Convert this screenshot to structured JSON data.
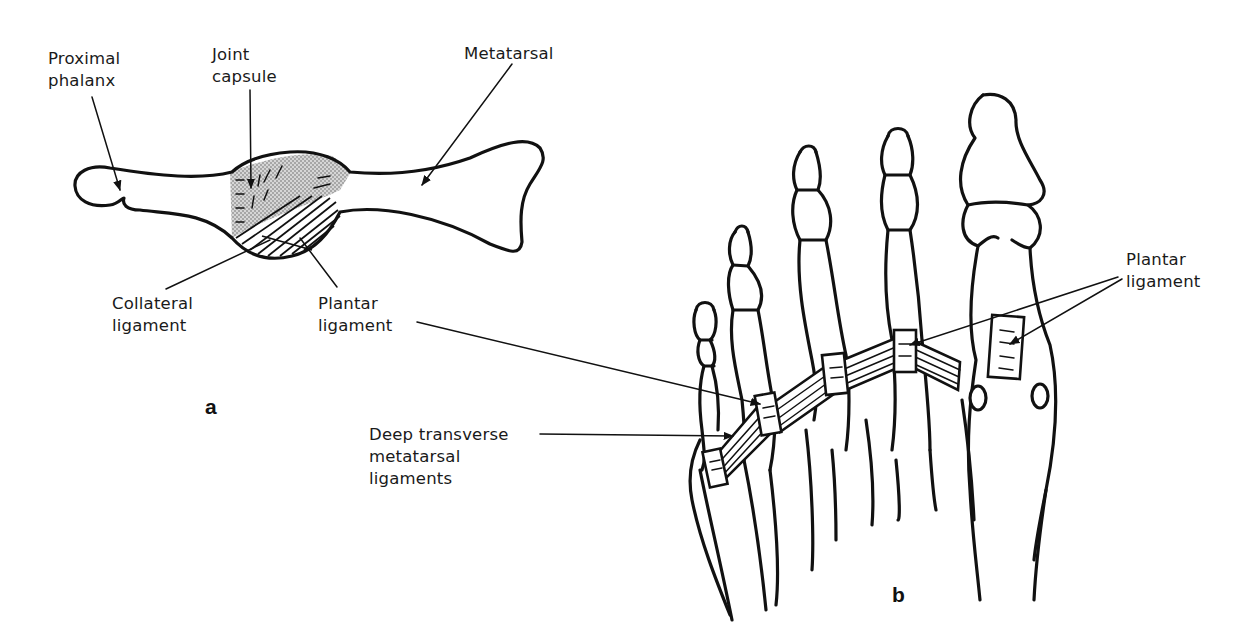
{
  "figure": {
    "panels": [
      {
        "id": "a",
        "letter": "a",
        "subject": "Metatarsophalangeal joint, lateral view",
        "labels": {
          "proximal_phalanx": "Proximal\nphalanx",
          "joint_capsule": "Joint\ncapsule",
          "metatarsal": "Metatarsal",
          "collateral_ligament": "Collateral\nligament",
          "plantar_ligament": "Plantar\nligament"
        }
      },
      {
        "id": "b",
        "letter": "b",
        "subject": "Forefoot, plantar view",
        "labels": {
          "plantar_ligament": "Plantar\nligament",
          "deep_transverse": "Deep transverse\nmetatarsal\nligaments"
        }
      }
    ],
    "colors": {
      "ink": "#111111",
      "capsule_fill": "#c8c8c8",
      "background": "#ffffff"
    }
  }
}
